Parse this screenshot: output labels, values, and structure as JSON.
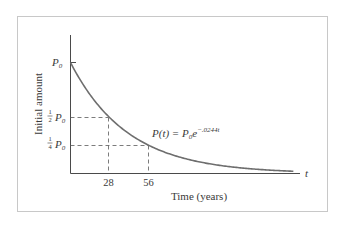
{
  "chart_data": {
    "type": "line",
    "title": "",
    "xlabel": "Time (years)",
    "ylabel": "Initial amount",
    "x_axis_symbol": "t",
    "formula": {
      "lhs": "P(t) = P",
      "lhs_sub": "0",
      "base": "e",
      "exponent": "−.0244t"
    },
    "x_ticks": [
      {
        "value": 28,
        "label": "28"
      },
      {
        "value": 56,
        "label": "56"
      }
    ],
    "y_ticks": [
      {
        "value": 1.0,
        "label": "P",
        "sub": "0",
        "frac": ""
      },
      {
        "value": 0.5,
        "label": "P",
        "sub": "0",
        "frac_num": "1",
        "frac_den": "2"
      },
      {
        "value": 0.25,
        "label": "P",
        "sub": "0",
        "frac_num": "1",
        "frac_den": "4"
      }
    ],
    "series": [
      {
        "name": "P(t) = P0 e^(-0.0244t)",
        "decay_rate": 0.0244,
        "x": [
          0,
          10,
          20,
          28,
          40,
          56,
          70,
          85,
          100,
          120,
          140,
          160
        ],
        "values": [
          1.0,
          0.7835,
          0.6139,
          0.5049,
          0.3768,
          0.2549,
          0.1812,
          0.1257,
          0.0872,
          0.0535,
          0.0328,
          0.0202
        ]
      }
    ],
    "reference_lines": [
      {
        "x": 28,
        "y": 0.5,
        "style": "dashed"
      },
      {
        "x": 56,
        "y": 0.25,
        "style": "dashed"
      }
    ],
    "xlim": [
      0,
      170
    ],
    "ylim": [
      0,
      1.0
    ],
    "grid": false,
    "legend": "none"
  },
  "labels": {
    "p0": "P",
    "p0_sub": "0",
    "half_num": "1",
    "half_den": "2",
    "quarter_num": "1",
    "quarter_den": "4",
    "tick_28": "28",
    "tick_56": "56",
    "x_symbol": "t",
    "xlabel": "Time (years)",
    "ylabel": "Initial amount",
    "formula_lhs": "P(t) = P",
    "formula_sub": "0",
    "formula_e": "e",
    "formula_exp": "−.0244t"
  },
  "colors": {
    "curve": "#6e6e6e",
    "axis": "#4a4a4a",
    "dashed": "#5a5a5a",
    "frame": "#c8c8c8",
    "text": "#3a3a3a"
  }
}
